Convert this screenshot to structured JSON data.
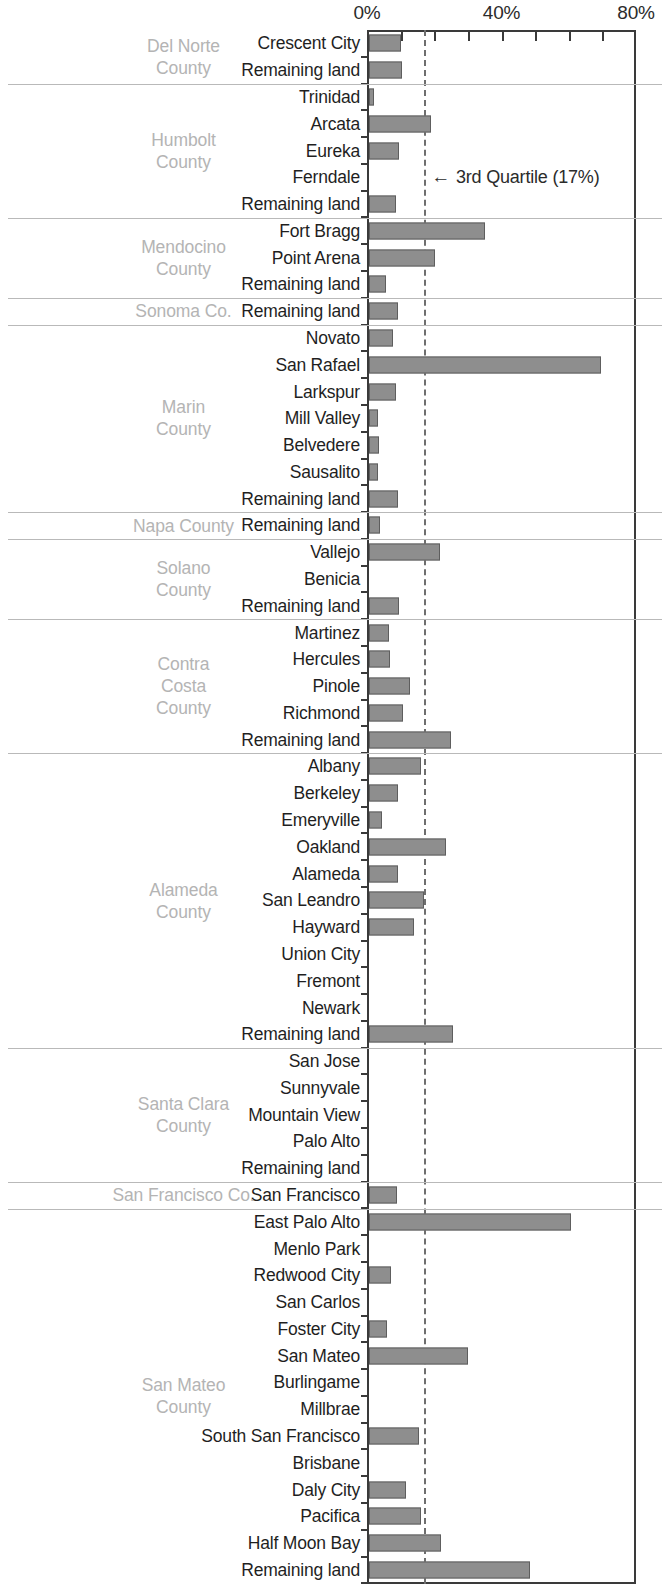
{
  "chart_data": {
    "type": "bar",
    "orientation": "horizontal",
    "title": "",
    "xlabel": "",
    "ylabel": "",
    "xlim": [
      0,
      80
    ],
    "grid": false,
    "legend": false,
    "axis_ticks": [
      "0%",
      "40%",
      "80%"
    ],
    "axis_tick_values": [
      0,
      40,
      80
    ],
    "annotation": {
      "arrow": "←",
      "text": "3rd Quartile (17%)",
      "value": 17
    },
    "quartile_value": 17,
    "bar_color": "#8e8e8e",
    "bar_border_color": "#5e5e5e",
    "county_label_color": "#b4b4b4",
    "city_label_color": "#1f1f1f",
    "groups": [
      {
        "county": "Del Norte\nCounty",
        "rows": [
          {
            "label": "Crescent City",
            "value": 9.5
          },
          {
            "label": "Remaining land",
            "value": 9.8
          }
        ]
      },
      {
        "county": "Humbolt\nCounty",
        "rows": [
          {
            "label": "Trinidad",
            "value": 1.6
          },
          {
            "label": "Arcata",
            "value": 18.4
          },
          {
            "label": "Eureka",
            "value": 8.9
          },
          {
            "label": "Ferndale",
            "value": 0
          },
          {
            "label": "Remaining land",
            "value": 8.0
          }
        ]
      },
      {
        "county": "Mendocino\nCounty",
        "rows": [
          {
            "label": "Fort Bragg",
            "value": 34.5
          },
          {
            "label": "Point Arena",
            "value": 19.5
          },
          {
            "label": "Remaining land",
            "value": 5.0
          }
        ]
      },
      {
        "county": "Sonoma Co.",
        "rows": [
          {
            "label": "Remaining land",
            "value": 8.6
          }
        ]
      },
      {
        "county": "Marin\nCounty",
        "rows": [
          {
            "label": "Novato",
            "value": 7.0
          },
          {
            "label": "San Rafael",
            "value": 69.0
          },
          {
            "label": "Larkspur",
            "value": 8.0
          },
          {
            "label": "Mill Valley",
            "value": 2.6
          },
          {
            "label": "Belvedere",
            "value": 2.9
          },
          {
            "label": "Sausalito",
            "value": 2.6
          },
          {
            "label": "Remaining land",
            "value": 8.5
          }
        ]
      },
      {
        "county": "Napa County",
        "rows": [
          {
            "label": "Remaining land",
            "value": 3.2
          }
        ]
      },
      {
        "county": "Solano\nCounty",
        "rows": [
          {
            "label": "Vallejo",
            "value": 21.0
          },
          {
            "label": "Benicia",
            "value": 0
          },
          {
            "label": "Remaining land",
            "value": 8.8
          }
        ]
      },
      {
        "county": "Contra\nCosta\nCounty",
        "rows": [
          {
            "label": "Martinez",
            "value": 5.9
          },
          {
            "label": "Hercules",
            "value": 6.3
          },
          {
            "label": "Pinole",
            "value": 12.2
          },
          {
            "label": "Richmond",
            "value": 10.0
          },
          {
            "label": "Remaining land",
            "value": 24.5
          }
        ]
      },
      {
        "county": "Alameda\nCounty",
        "rows": [
          {
            "label": "Albany",
            "value": 15.5
          },
          {
            "label": "Berkeley",
            "value": 8.5
          },
          {
            "label": "Emeryville",
            "value": 4.0
          },
          {
            "label": "Oakland",
            "value": 23.0
          },
          {
            "label": "Alameda",
            "value": 8.5
          },
          {
            "label": "San Leandro",
            "value": 16.5
          },
          {
            "label": "Hayward",
            "value": 13.5
          },
          {
            "label": "Union City",
            "value": 0
          },
          {
            "label": "Fremont",
            "value": 0
          },
          {
            "label": "Newark",
            "value": 0
          },
          {
            "label": "Remaining land",
            "value": 25.0
          }
        ]
      },
      {
        "county": "Santa Clara\nCounty",
        "rows": [
          {
            "label": "San Jose",
            "value": 0
          },
          {
            "label": "Sunnyvale",
            "value": 0
          },
          {
            "label": "Mountain View",
            "value": 0
          },
          {
            "label": "Palo Alto",
            "value": 0
          },
          {
            "label": "Remaining land",
            "value": 0
          }
        ]
      },
      {
        "county": "San Francisco Co.",
        "rows": [
          {
            "label": "San Francisco",
            "value": 8.3
          }
        ]
      },
      {
        "county": "San Mateo\nCounty",
        "rows": [
          {
            "label": "East Palo Alto",
            "value": 60.0
          },
          {
            "label": "Menlo Park",
            "value": 0
          },
          {
            "label": "Redwood City",
            "value": 6.5
          },
          {
            "label": "San Carlos",
            "value": 0
          },
          {
            "label": "Foster City",
            "value": 5.5
          },
          {
            "label": "San Mateo",
            "value": 29.5
          },
          {
            "label": "Burlingame",
            "value": 0
          },
          {
            "label": "Millbrae",
            "value": 0
          },
          {
            "label": "South San Francisco",
            "value": 15.0
          },
          {
            "label": "Brisbane",
            "value": 0
          },
          {
            "label": "Daly City",
            "value": 11.0
          },
          {
            "label": "Pacifica",
            "value": 15.5
          },
          {
            "label": "Half Moon Bay",
            "value": 21.5
          },
          {
            "label": "Remaining land",
            "value": 48.0
          }
        ]
      }
    ]
  }
}
